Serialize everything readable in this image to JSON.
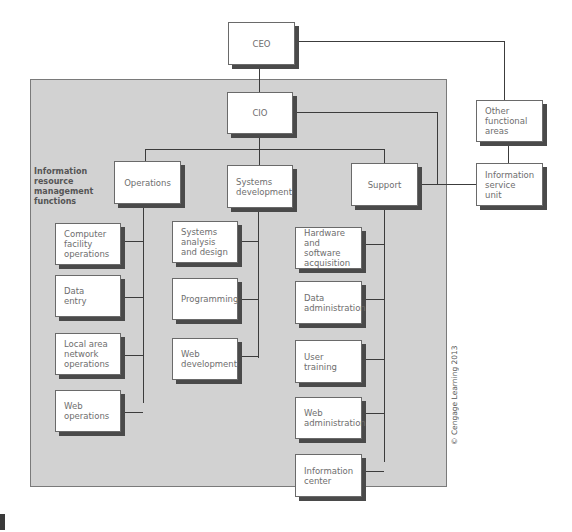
{
  "diagram": {
    "panel_label": "Information resource\nmanagement\nfunctions",
    "copyright": "© Cengage Learning 2013",
    "nodes": {
      "ceo": "CEO",
      "cio": "CIO",
      "other_functional_areas": "Other functional\nareas",
      "information_service_unit": "Information\nservice\nunit",
      "operations": "Operations",
      "systems_development": "Systems\ndevelopment",
      "support": "Support"
    },
    "operations_children": [
      "Computer\nfacility\noperations",
      "Data\nentry",
      "Local area\nnetwork\noperations",
      "Web\noperations"
    ],
    "systems_development_children": [
      "Systems\nanalysis\nand design",
      "Programming",
      "Web\ndevelopment"
    ],
    "support_children": [
      "Hardware and\nsoftware\nacquisition",
      "Data\nadministration",
      "User\ntraining",
      "Web\nadministration",
      "Information\ncenter"
    ],
    "colors": {
      "panel": "#d2d2d2",
      "box": "#ffffff",
      "shadow": "#4a4a4a",
      "line": "#3c3c3c",
      "text": "#6e6e6e"
    }
  }
}
